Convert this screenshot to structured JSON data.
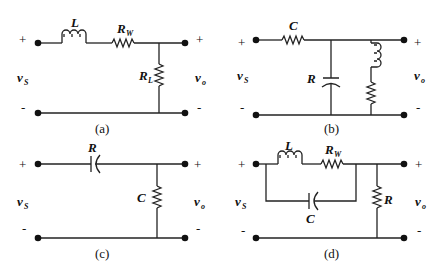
{
  "figure": {
    "panels": [
      {
        "id": "a",
        "caption": "(a)",
        "input": {
          "plus": "+",
          "minus": "-",
          "label": "v",
          "sub": "S"
        },
        "output": {
          "plus": "+",
          "minus": "-",
          "label": "v",
          "sub": "o"
        },
        "components": [
          {
            "type": "inductor",
            "label": "L",
            "sub": "",
            "placement": "series-top"
          },
          {
            "type": "resistor",
            "label": "R",
            "sub": "W",
            "placement": "series-top"
          },
          {
            "type": "resistor",
            "label": "R",
            "sub": "L",
            "placement": "shunt"
          }
        ]
      },
      {
        "id": "b",
        "caption": "(b)",
        "input": {
          "plus": "+",
          "minus": "-",
          "label": "v",
          "sub": "S"
        },
        "output": {
          "plus": "+",
          "minus": "-",
          "label": "v",
          "sub": "o"
        },
        "components": [
          {
            "type": "capacitor",
            "label": "C",
            "sub": "",
            "placement": "series-top"
          },
          {
            "type": "resistor",
            "label": "R",
            "sub": "L",
            "placement": "shunt"
          }
        ]
      },
      {
        "id": "c",
        "caption": "(c)",
        "input": {
          "plus": "+",
          "minus": "-",
          "label": "v",
          "sub": "S"
        },
        "output": {
          "plus": "+",
          "minus": "-",
          "label": "v",
          "sub": "o"
        },
        "components": [
          {
            "type": "resistor",
            "label": "R",
            "sub": "",
            "placement": "series-top"
          },
          {
            "type": "capacitor",
            "label": "C",
            "sub": "",
            "placement": "shunt"
          },
          {
            "type": "inductor",
            "label": "L",
            "sub": "",
            "placement": "shunt-series"
          },
          {
            "type": "resistor",
            "label": "R",
            "sub": "W",
            "placement": "shunt-series"
          }
        ]
      },
      {
        "id": "d",
        "caption": "(d)",
        "input": {
          "plus": "+",
          "minus": "-",
          "label": "v",
          "sub": "S"
        },
        "output": {
          "plus": "+",
          "minus": "-",
          "label": "v",
          "sub": "o"
        },
        "components": [
          {
            "type": "inductor",
            "label": "L",
            "sub": "",
            "placement": "parallel-branch-top"
          },
          {
            "type": "resistor",
            "label": "R",
            "sub": "W",
            "placement": "parallel-branch-top"
          },
          {
            "type": "capacitor",
            "label": "C",
            "sub": "",
            "placement": "parallel-branch-bottom"
          },
          {
            "type": "resistor",
            "label": "R",
            "sub": "",
            "placement": "shunt"
          }
        ]
      }
    ]
  }
}
